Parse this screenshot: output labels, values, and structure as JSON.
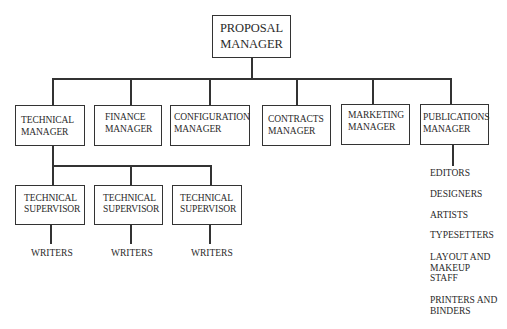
{
  "root": {
    "line1": "PROPOSAL",
    "line2": "MANAGER"
  },
  "managers": [
    {
      "line1": "TECHNICAL",
      "line2": "MANAGER"
    },
    {
      "line1": "FINANCE",
      "line2": "MANAGER"
    },
    {
      "line1": "CONFIGURATION",
      "line2": "MANAGER"
    },
    {
      "line1": "CONTRACTS",
      "line2": "MANAGER"
    },
    {
      "line1": "MARKETING",
      "line2": "MANAGER"
    },
    {
      "line1": "PUBLICATIONS",
      "line2": "MANAGER"
    }
  ],
  "supervisors": [
    {
      "line1": "TECHNICAL",
      "line2": "SUPERVISOR",
      "staff": "WRITERS"
    },
    {
      "line1": "TECHNICAL",
      "line2": "SUPERVISOR",
      "staff": "WRITERS"
    },
    {
      "line1": "TECHNICAL",
      "line2": "SUPERVISOR",
      "staff": "WRITERS"
    }
  ],
  "publications_staff": [
    [
      "EDITORS"
    ],
    [
      "DESIGNERS"
    ],
    [
      "ARTISTS"
    ],
    [
      "TYPESETTERS"
    ],
    [
      "LAYOUT AND",
      "MAKEUP",
      "STAFF"
    ],
    [
      "PRINTERS AND",
      "BINDERS"
    ]
  ]
}
